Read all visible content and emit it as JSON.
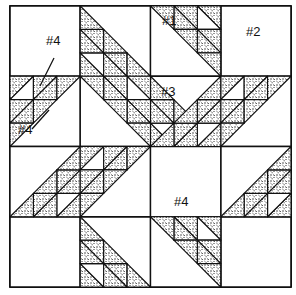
{
  "figure": {
    "type": "quilt-block-diagram",
    "block": {
      "x0": 10,
      "y0": 6,
      "size": 281,
      "grid": 4
    },
    "colors": {
      "line": "#111111",
      "print": "#2a2a2a",
      "fabric_bg": "#ffffff"
    },
    "labels": [
      {
        "id": "label-1",
        "text": "#1",
        "x": 162,
        "y": 24
      },
      {
        "id": "label-2",
        "text": "#2",
        "x": 246,
        "y": 35
      },
      {
        "id": "label-3",
        "text": "#3",
        "x": 161,
        "y": 95
      },
      {
        "id": "label-4a",
        "text": "#4",
        "x": 46,
        "y": 44
      },
      {
        "id": "label-4b",
        "text": "#4",
        "x": 18,
        "y": 133
      },
      {
        "id": "label-4c",
        "text": "#4",
        "x": 174,
        "y": 205
      }
    ],
    "leaders": [
      {
        "x1": 54,
        "y1": 58,
        "x2": 40,
        "y2": 86
      },
      {
        "x1": 32,
        "y1": 129,
        "x2": 49,
        "y2": 110
      }
    ],
    "pieces": {
      "1": "side setting triangle",
      "2": "corner square",
      "3": "center square/triangle",
      "4": "small half-square triangle"
    }
  }
}
